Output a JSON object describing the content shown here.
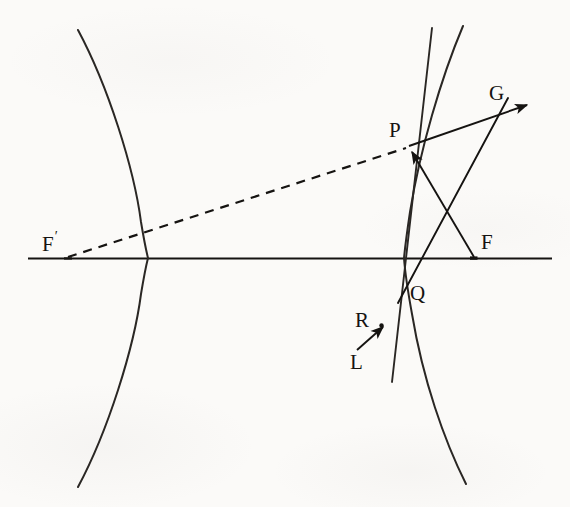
{
  "figure": {
    "kind": "geometry-diagram",
    "width": 570,
    "height": 507,
    "background_color": "#fbfaf8",
    "ink_color": "#151311"
  },
  "labels": {
    "F_prime": {
      "text": "F",
      "prime": "′"
    },
    "F": {
      "text": "F"
    },
    "P": {
      "text": "P"
    },
    "G": {
      "text": "G"
    },
    "Q": {
      "text": "Q"
    },
    "R": {
      "text": "R"
    },
    "L": {
      "text": "L"
    }
  },
  "points": {
    "F_prime": {
      "x": 68,
      "y": 258
    },
    "F": {
      "x": 474,
      "y": 258
    },
    "P": {
      "x": 408,
      "y": 147
    },
    "Q": {
      "x": 405,
      "y": 287
    },
    "R": {
      "x": 381,
      "y": 326
    },
    "G_arrow": {
      "x": 526,
      "y": 105
    },
    "G_join": {
      "x": 505,
      "y": 97
    },
    "L_start": {
      "x": 357,
      "y": 350
    }
  },
  "axis": {
    "name": "optical-axis",
    "x1": 28,
    "y1": 258,
    "x2": 552,
    "y2": 258
  },
  "curves": {
    "left_branch": {
      "name": "left-hyperbola-branch",
      "vertex": {
        "x": 148,
        "y": 258
      },
      "top": {
        "x": 78,
        "y": 30
      },
      "bottom": {
        "x": 78,
        "y": 487
      },
      "opens": "left"
    },
    "right_branch": {
      "name": "right-hyperbola-branch",
      "vertex": {
        "x": 404,
        "y": 258
      },
      "top": {
        "x": 463,
        "y": 26
      },
      "bottom": {
        "x": 466,
        "y": 484
      },
      "opens": "right"
    }
  },
  "segments": [
    {
      "name": "dashed-line-Fprime-to-P",
      "style": "dashed",
      "from": "F_prime",
      "to": "P",
      "arrow": false
    },
    {
      "name": "ray-F-to-P",
      "style": "solid",
      "from": "F",
      "to": "P",
      "arrow": true
    },
    {
      "name": "ray-P-to-G",
      "style": "solid",
      "from": "P",
      "to": "G_arrow",
      "arrow": true
    },
    {
      "name": "ray-Q-to-G",
      "style": "solid",
      "from": "Q",
      "to": "G_join",
      "arrow": false
    },
    {
      "name": "ray-L-to-R",
      "style": "solid",
      "from": "L_start",
      "to": "R",
      "arrow": true
    },
    {
      "name": "tangent-line-at-P",
      "style": "solid",
      "note": "near-vertical line through P extending above and below"
    }
  ]
}
